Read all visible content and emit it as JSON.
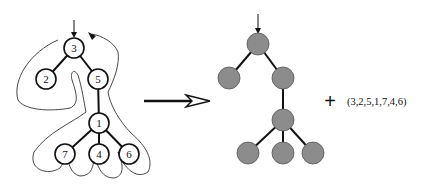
{
  "diagram": {
    "left_tree": {
      "description": "Labeled tree with Euler-tour contour",
      "nodes": [
        {
          "id": "n3",
          "label": "3",
          "x": 74,
          "y": 48
        },
        {
          "id": "n2",
          "label": "2",
          "x": 46,
          "y": 79
        },
        {
          "id": "n5",
          "label": "5",
          "x": 98,
          "y": 79
        },
        {
          "id": "n1",
          "label": "1",
          "x": 99,
          "y": 123
        },
        {
          "id": "n7",
          "label": "7",
          "x": 65,
          "y": 154
        },
        {
          "id": "n4",
          "label": "4",
          "x": 99,
          "y": 154
        },
        {
          "id": "n6",
          "label": "6",
          "x": 129,
          "y": 154
        }
      ],
      "edges": [
        [
          "n3",
          "n2"
        ],
        [
          "n3",
          "n5"
        ],
        [
          "n5",
          "n1"
        ],
        [
          "n1",
          "n7"
        ],
        [
          "n1",
          "n4"
        ],
        [
          "n1",
          "n6"
        ]
      ],
      "root_arrow": true,
      "contour": true
    },
    "transform_arrow": {
      "from_x": 144,
      "to_x": 210,
      "y": 101
    },
    "right_tree": {
      "description": "Unlabeled tree shape",
      "node_color": "#8c8c8c",
      "nodes": [
        {
          "id": "r0",
          "x": 258,
          "y": 44
        },
        {
          "id": "r1",
          "x": 229,
          "y": 78
        },
        {
          "id": "r2",
          "x": 283,
          "y": 78
        },
        {
          "id": "r3",
          "x": 283,
          "y": 120
        },
        {
          "id": "r4",
          "x": 248,
          "y": 153
        },
        {
          "id": "r5",
          "x": 283,
          "y": 153
        },
        {
          "id": "r6",
          "x": 313,
          "y": 153
        }
      ],
      "edges": [
        [
          "r0",
          "r1"
        ],
        [
          "r0",
          "r2"
        ],
        [
          "r2",
          "r3"
        ],
        [
          "r3",
          "r4"
        ],
        [
          "r3",
          "r5"
        ],
        [
          "r3",
          "r6"
        ]
      ],
      "root_arrow": true
    },
    "plus_sign": "+",
    "sequence": "(3,2,5,1,7,4,6)"
  }
}
